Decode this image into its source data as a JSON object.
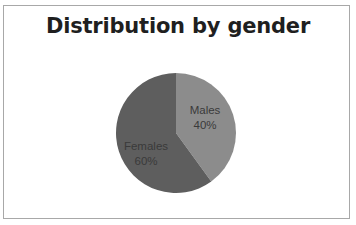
{
  "chart_data": {
    "type": "pie",
    "title": "Distribution by gender",
    "categories": [
      "Males",
      "Females"
    ],
    "values": [
      40,
      60
    ],
    "value_labels": [
      "40%",
      "60%"
    ],
    "colors": [
      "#8c8c8c",
      "#5e5e5e"
    ],
    "start_angle_deg": 0,
    "direction": "clockwise",
    "legend": "none",
    "data_labels": "inside, category name and percentage"
  },
  "labels": {
    "males_name": "Males",
    "males_pct": "40%",
    "females_name": "Females",
    "females_pct": "60%"
  }
}
